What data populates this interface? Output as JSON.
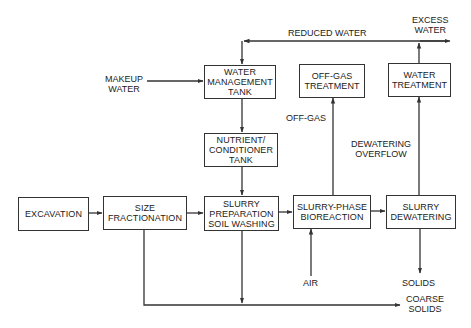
{
  "colors": {
    "line": "#333333",
    "background": "#ffffff",
    "text": "#222222"
  },
  "boxes": {
    "water_management": "WATER\nMANAGEMENT\nTANK",
    "nutrient_conditioner": "NUTRIENT/\nCONDITIONER\nTANK",
    "slurry_preparation": "SLURRY\nPREPARATION\nSOIL WASHING",
    "excavation": "EXCAVATION",
    "size_fractionation": "SIZE\nFRACTIONATION",
    "bioreaction": "SLURRY-PHASE\nBIOREACTION",
    "dewatering": "SLURRY\nDEWATERING",
    "off_gas_treatment": "OFF-GAS\nTREATMENT",
    "water_treatment": "WATER\nTREATMENT"
  },
  "labels": {
    "reduced_water": "REDUCED WATER",
    "excess_water": "EXCESS\nWATER",
    "makeup_water": "MAKEUP\nWATER",
    "off_gas": "OFF-GAS",
    "dewatering_overflow": "DEWATERING\nOVERFLOW",
    "air": "AIR",
    "solids": "SOLIDS",
    "coarse_solids": "COARSE\nSOLIDS"
  }
}
